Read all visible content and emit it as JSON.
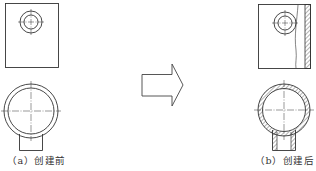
{
  "figure": {
    "before": {
      "label": "（a）创建前"
    },
    "after": {
      "label": "（b）创建后"
    },
    "arrow": {
      "direction": "right",
      "icon": "block-arrow-right-icon"
    },
    "colors": {
      "stroke": "#333333",
      "background": "#ffffff"
    }
  }
}
